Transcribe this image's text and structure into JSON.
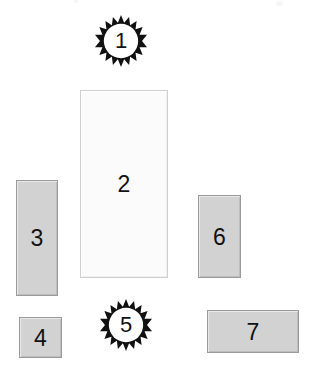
{
  "page": {
    "background_color": "#ffffff",
    "width": 320,
    "height": 375
  },
  "style": {
    "gray_fill": "#d2d2d2",
    "gray_border": "#9a9a9a",
    "light_fill": "#fbfbfb",
    "light_border": "#cfcfcf",
    "starburst_fill": "#111111",
    "label_color": "#111111"
  },
  "shapes": [
    {
      "id": "shape-1",
      "label": "1",
      "kind": "starburst",
      "x": 95,
      "y": 15,
      "width": 52,
      "height": 52,
      "points": 18,
      "fill": "#111111"
    },
    {
      "id": "shape-2",
      "label": "2",
      "kind": "rectangle-light",
      "x": 80,
      "y": 90,
      "width": 88,
      "height": 188,
      "fill": "#fbfbfb"
    },
    {
      "id": "shape-3",
      "label": "3",
      "kind": "rectangle-gray",
      "x": 16,
      "y": 180,
      "width": 42,
      "height": 116,
      "fill": "#d2d2d2"
    },
    {
      "id": "shape-4",
      "label": "4",
      "kind": "rectangle-gray",
      "x": 19,
      "y": 317,
      "width": 43,
      "height": 41,
      "fill": "#d2d2d2"
    },
    {
      "id": "shape-5",
      "label": "5",
      "kind": "starburst",
      "x": 100,
      "y": 299,
      "width": 52,
      "height": 52,
      "points": 18,
      "fill": "#111111"
    },
    {
      "id": "shape-6",
      "label": "6",
      "kind": "rectangle-gray",
      "x": 198,
      "y": 195,
      "width": 43,
      "height": 83,
      "fill": "#d2d2d2"
    },
    {
      "id": "shape-7",
      "label": "7",
      "kind": "rectangle-gray",
      "x": 207,
      "y": 310,
      "width": 92,
      "height": 43,
      "fill": "#d2d2d2"
    }
  ]
}
